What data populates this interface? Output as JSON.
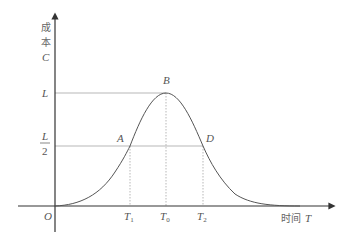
{
  "diagram": {
    "type": "bell-curve cost-time plot",
    "y_axis": {
      "label_line1": "成",
      "label_line2": "本",
      "label_symbol": "C",
      "ticks": [
        {
          "label": "L"
        },
        {
          "label_num": "L",
          "label_den": "2"
        }
      ]
    },
    "x_axis": {
      "label_text": "时间",
      "label_symbol": "T",
      "origin": "O",
      "ticks": [
        {
          "base": "T",
          "sub": "1"
        },
        {
          "base": "T",
          "sub": "0"
        },
        {
          "base": "T",
          "sub": "2"
        }
      ]
    },
    "points": {
      "A": "A",
      "B": "B",
      "D": "D"
    },
    "colors": {
      "axis": "#333333",
      "curve": "#555555",
      "guide": "#999999",
      "text": "#555555"
    }
  }
}
